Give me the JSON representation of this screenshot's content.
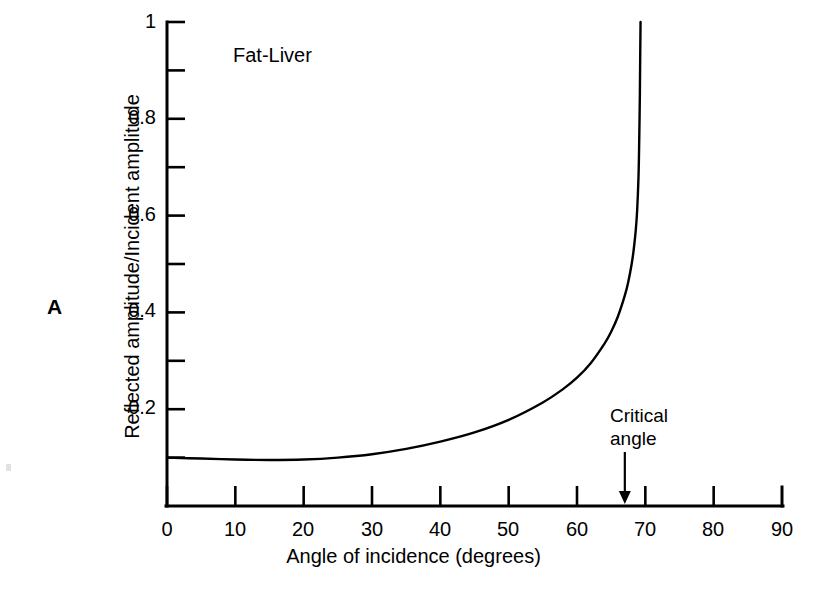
{
  "figure": {
    "panel_label": "A",
    "background": "#ffffff",
    "ink_color": "#000000"
  },
  "chart_data": {
    "type": "line",
    "title": "Fat-Liver",
    "xlabel": "Angle of incidence (degrees)",
    "ylabel": "Reflected amplitude/Incident amplitude",
    "xlim": [
      0,
      90
    ],
    "ylim": [
      0,
      1
    ],
    "grid": false,
    "legend": null,
    "x_ticks_major": [
      0,
      10,
      20,
      30,
      40,
      50,
      60,
      70,
      80,
      90
    ],
    "x_tick_labels": [
      "0",
      "10",
      "20",
      "30",
      "40",
      "50",
      "60",
      "70",
      "80",
      "90"
    ],
    "y_ticks_major": [
      0.2,
      0.4,
      0.6,
      0.8,
      1
    ],
    "y_tick_labels": [
      "0.2",
      "0.4",
      "0.6",
      "0.8",
      "1"
    ],
    "y_ticks_minor": [
      0.1,
      0.3,
      0.5,
      0.7,
      0.9
    ],
    "series": [
      {
        "name": "Fat-Liver reflection coefficient",
        "x": [
          0,
          5,
          10,
          15,
          20,
          25,
          30,
          35,
          40,
          45,
          50,
          55,
          58,
          60,
          62,
          64,
          65,
          66,
          67,
          67.5,
          68,
          68.3,
          68.6,
          68.8,
          69,
          69.1,
          69.2,
          69.25,
          69.3
        ],
        "y": [
          0.1,
          0.098,
          0.096,
          0.095,
          0.096,
          0.1,
          0.107,
          0.118,
          0.133,
          0.152,
          0.178,
          0.214,
          0.242,
          0.265,
          0.295,
          0.335,
          0.36,
          0.392,
          0.435,
          0.463,
          0.5,
          0.53,
          0.57,
          0.61,
          0.68,
          0.75,
          0.85,
          0.93,
          1.0
        ]
      }
    ],
    "annotations": [
      {
        "name": "critical-angle",
        "text_line1": "Critical",
        "text_line2": "angle",
        "arrow_points_to_x": 67,
        "arrow_points_to_y": 0
      }
    ]
  }
}
